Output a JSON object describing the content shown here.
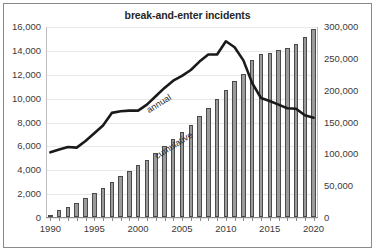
{
  "chart_data": {
    "type": "bar",
    "title": "break-and-enter incidents",
    "xlabel": "",
    "ylabel": "",
    "grid": true,
    "legend_position": "inline-annotations",
    "x": [
      1990,
      1991,
      1992,
      1993,
      1994,
      1995,
      1996,
      1997,
      1998,
      1999,
      2000,
      2001,
      2002,
      2003,
      2004,
      2005,
      2006,
      2007,
      2008,
      2009,
      2010,
      2011,
      2012,
      2013,
      2014,
      2015,
      2016,
      2017,
      2018,
      2019,
      2020
    ],
    "x_tick_labels": [
      "1990",
      "1995",
      "2000",
      "2005",
      "2010",
      "2015",
      "2020"
    ],
    "x_tick_values": [
      1990,
      1995,
      2000,
      2005,
      2010,
      2015,
      2020
    ],
    "series": [
      {
        "name": "cumulative",
        "type": "bar",
        "axis": "right",
        "values": [
          2500,
          11000,
          22000,
          34000,
          47000,
          62000,
          79000,
          97000,
          117000,
          139000,
          163000,
          188000,
          215000,
          244000,
          275000,
          307000,
          341000,
          376000,
          413000,
          452000,
          493000,
          535000,
          578000,
          620000,
          661000,
          701000,
          740000,
          778000,
          816000,
          853000,
          890000
        ],
        "values_right_axis": [
          2500,
          11000,
          22000,
          34000,
          47000,
          62000,
          79000,
          97000,
          117000,
          139000,
          163000,
          188000,
          215000,
          244000,
          275000,
          307000,
          341000,
          376000,
          413000,
          452000,
          493000,
          535000,
          578000,
          620000,
          661000,
          701000,
          740000,
          778000,
          816000,
          853000,
          890000
        ],
        "plotted_values": [
          2500,
          11000,
          16000,
          22000,
          30000,
          38000,
          46000,
          55000,
          64000,
          73000,
          82000,
          90000,
          100000,
          111000,
          123000,
          133000,
          145000,
          159000,
          172000,
          185000,
          200000,
          213000,
          225000,
          247000,
          256000,
          258000,
          262000,
          265000,
          272000,
          283000,
          295000
        ]
      },
      {
        "name": "annual",
        "type": "line",
        "axis": "left",
        "values": [
          5500,
          5750,
          5950,
          5900,
          6450,
          7100,
          7750,
          8800,
          8950,
          9000,
          9000,
          9500,
          10200,
          10900,
          11500,
          11900,
          12400,
          13100,
          13700,
          13700,
          14800,
          14300,
          13200,
          11300,
          10050,
          9800,
          9500,
          9200,
          9150,
          8600,
          8400
        ]
      }
    ],
    "left_axis": {
      "min": 0,
      "max": 16000,
      "step": 2000,
      "tick_labels": [
        "0",
        "2,000",
        "4,000",
        "6,000",
        "8,000",
        "10,000",
        "12,000",
        "14,000",
        "16,000"
      ],
      "tick_values": [
        0,
        2000,
        4000,
        6000,
        8000,
        10000,
        12000,
        14000,
        16000
      ]
    },
    "right_axis": {
      "min": 0,
      "max": 300000,
      "step": 50000,
      "tick_labels": [
        "0",
        "50,000",
        "100,000",
        "150,000",
        "200,000",
        "250,000",
        "300,000"
      ],
      "tick_values": [
        0,
        50000,
        100000,
        150000,
        200000,
        250000,
        300000
      ]
    },
    "annotations": [
      {
        "text": "annual",
        "rotation": -32
      },
      {
        "text": "cumulative",
        "rotation": -32
      }
    ],
    "colors": {
      "bar_fill": "#9b9b9b",
      "bar_stroke": "#4a4a4a",
      "line": "#1a1a1a",
      "grid": "#e8e8e8",
      "text": "#3a3a3a",
      "title": "#262626",
      "frame": "#8a8a8a",
      "background": "#ffffff"
    }
  }
}
